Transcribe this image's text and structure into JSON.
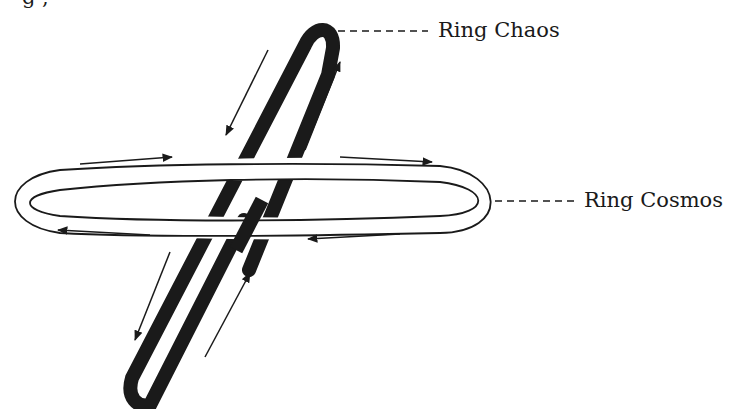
{
  "diagram": {
    "partial_top_text": "g     ,",
    "labels": {
      "ring_chaos": "Ring Chaos",
      "ring_cosmos": "Ring Cosmos"
    },
    "colors": {
      "stroke": "#1a1a1a",
      "background": "#ffffff"
    },
    "elements": [
      {
        "name": "Ring Chaos",
        "style": "thick solid black ring",
        "orientation": "tilted near-vertical",
        "flow": "counter-clockwise arrows"
      },
      {
        "name": "Ring Cosmos",
        "style": "hollow double-line ring",
        "orientation": "horizontal",
        "flow": "clockwise arrows"
      }
    ]
  }
}
